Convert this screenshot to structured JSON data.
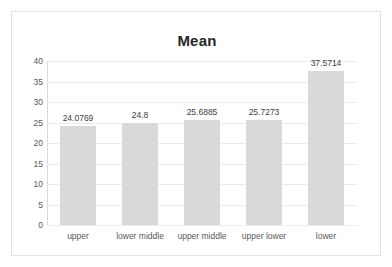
{
  "chart_data": {
    "type": "bar",
    "title": "Mean",
    "xlabel": "",
    "ylabel": "",
    "ylim": [
      0,
      40
    ],
    "yticks": [
      0,
      5,
      10,
      15,
      20,
      25,
      30,
      35,
      40
    ],
    "grid": true,
    "legend": false,
    "bar_color": "#d9d9d9",
    "categories": [
      "upper",
      "lower middle",
      "upper middle",
      "upper lower",
      "lower"
    ],
    "values": [
      24.0769,
      24.8,
      25.6885,
      25.7273,
      37.5714
    ],
    "value_labels": [
      "24.0769",
      "24.8",
      "25.6885",
      "25.7273",
      "37.5714"
    ],
    "ytick_labels": [
      "40",
      "35",
      "30",
      "25",
      "20",
      "15",
      "10",
      "5",
      "0"
    ]
  }
}
